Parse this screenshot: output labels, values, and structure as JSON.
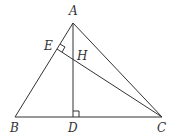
{
  "diagram": {
    "type": "triangle-geometry",
    "points": {
      "A": {
        "x": 73,
        "y": 23,
        "label": "A",
        "lx": 69,
        "ly": 15
      },
      "B": {
        "x": 15,
        "y": 117,
        "label": "B",
        "lx": 10,
        "ly": 132
      },
      "C": {
        "x": 162,
        "y": 117,
        "label": "C",
        "lx": 157,
        "ly": 132
      },
      "D": {
        "x": 73,
        "y": 117,
        "label": "D",
        "lx": 68,
        "ly": 132
      },
      "E": {
        "x": 57,
        "y": 49,
        "label": "E",
        "lx": 44,
        "ly": 50
      },
      "H": {
        "x": 73,
        "y": 59,
        "label": "H",
        "lx": 77,
        "ly": 59
      }
    },
    "segments": [
      "AB",
      "AC",
      "BC",
      "AD",
      "CE"
    ],
    "right_angles": [
      "D (AD ⊥ BC)",
      "E (CE ⊥ AB)"
    ]
  }
}
